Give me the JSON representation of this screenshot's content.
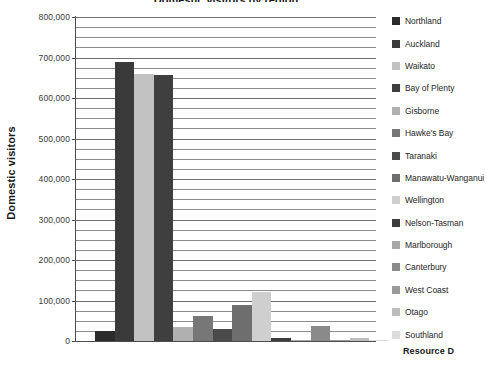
{
  "chart_data": {
    "type": "bar",
    "title": "Domestic visitors by region",
    "xlabel": "",
    "ylabel": "Domestic visitors",
    "ylim": [
      0,
      800000
    ],
    "ytick_step": 100000,
    "minor_gridline_step": 25000,
    "grid": true,
    "legend_position": "right",
    "categories": [
      "Northland",
      "Auckland",
      "Waikato",
      "Bay of Plenty",
      "Gisborne",
      "Hawke's Bay",
      "Taranaki",
      "Manawatu-Wanganui",
      "Wellington",
      "Nelson-Tasman",
      "Marlborough",
      "Canterbury",
      "West Coast",
      "Otago",
      "Southland"
    ],
    "values": [
      25000,
      690000,
      660000,
      657000,
      35000,
      63000,
      30000,
      88000,
      122000,
      7000,
      1000,
      38000,
      1000,
      7000,
      1000
    ],
    "colors": [
      "#2b2b2b",
      "#3a3a3a",
      "#c2c2c2",
      "#3f3f3f",
      "#b0b0b0",
      "#777777",
      "#4a4a4a",
      "#6e6e6e",
      "#cfcfcf",
      "#3c3c3c",
      "#a8a8a8",
      "#8a8a8a",
      "#9a9a9a",
      "#bdbdbd",
      "#dcdcdc"
    ],
    "ytick_labels": [
      "800,000",
      "700,000",
      "600,000",
      "500,000",
      "400,000",
      "300,000",
      "200,000",
      "100,000",
      "0"
    ],
    "ytick_values": [
      800000,
      700000,
      600000,
      500000,
      400000,
      300000,
      200000,
      100000,
      0
    ]
  },
  "footer": {
    "resource_label": "Resource D"
  }
}
